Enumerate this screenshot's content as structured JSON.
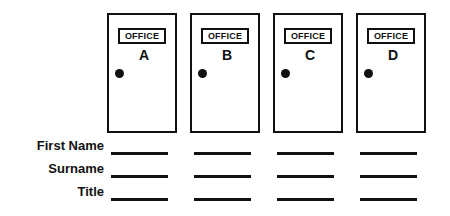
{
  "page": {
    "background_color": "#ffffff",
    "ink_color": "#111111"
  },
  "doors": [
    {
      "sign_label": "OFFICE",
      "letter": "A",
      "knob": "door-knob"
    },
    {
      "sign_label": "OFFICE",
      "letter": "B",
      "knob": "door-knob"
    },
    {
      "sign_label": "OFFICE",
      "letter": "C",
      "knob": "door-knob"
    },
    {
      "sign_label": "OFFICE",
      "letter": "D",
      "knob": "door-knob"
    }
  ],
  "form_rows": [
    {
      "label": "First Name",
      "values": [
        "",
        "",
        "",
        ""
      ]
    },
    {
      "label": "Surname",
      "values": [
        "",
        "",
        "",
        ""
      ]
    },
    {
      "label": "Title",
      "values": [
        "",
        "",
        "",
        ""
      ]
    }
  ]
}
